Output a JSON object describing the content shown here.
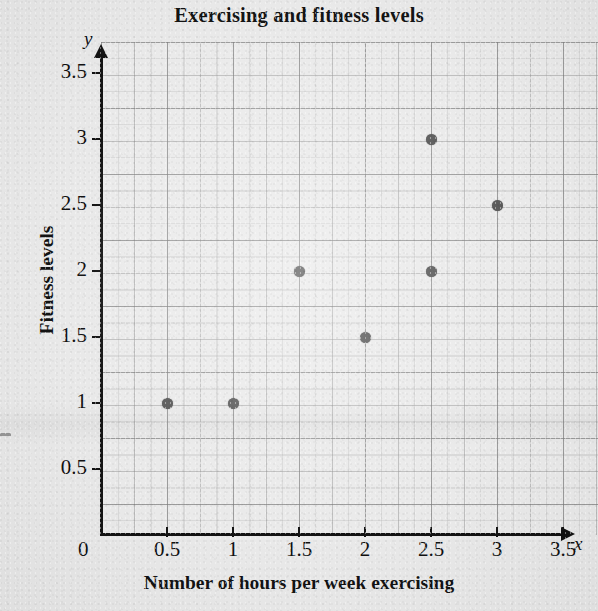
{
  "title": "Exercising and fitness levels",
  "axes": {
    "x_letter": "x",
    "y_letter": "y",
    "x_title": "Number of hours per week exercising",
    "y_title": "Fitness levels",
    "origin_label": "0"
  },
  "chart_data": {
    "type": "scatter",
    "title": "Exercising and fitness levels",
    "xlabel": "Number of hours per week exercising",
    "ylabel": "Fitness levels",
    "xlim": [
      0,
      3.5
    ],
    "ylim": [
      0,
      3.5
    ],
    "xticks": [
      "0",
      "0.5",
      "1",
      "1.5",
      "2",
      "2.5",
      "3",
      "3.5"
    ],
    "yticks": [
      "0",
      "0.5",
      "1",
      "1.5",
      "2",
      "2.5",
      "3",
      "3.5"
    ],
    "xtick_values": [
      0,
      0.5,
      1,
      1.5,
      2,
      2.5,
      3,
      3.5
    ],
    "ytick_values": [
      0,
      0.5,
      1,
      1.5,
      2,
      2.5,
      3,
      3.5
    ],
    "grid": true,
    "grid_minor_step": 0.125,
    "legend": null,
    "marker_color": "#565656",
    "points": [
      {
        "x": 0.5,
        "y": 1
      },
      {
        "x": 1,
        "y": 1
      },
      {
        "x": 1.5,
        "y": 2
      },
      {
        "x": 2,
        "y": 1.5
      },
      {
        "x": 2.5,
        "y": 2
      },
      {
        "x": 2.5,
        "y": 3
      },
      {
        "x": 3,
        "y": 2.5
      }
    ]
  }
}
